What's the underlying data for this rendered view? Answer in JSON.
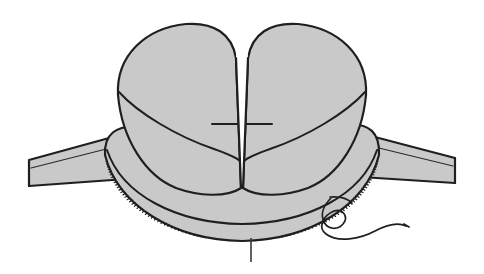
{
  "figure": {
    "title": "Surgical line illustration: split tubular tissue lobes within a serrated cuff",
    "caption": "",
    "background_color": "#ffffff",
    "style": "black-and-white halftone line drawing"
  },
  "palette": {
    "tissue_fill": "#c9c9c9",
    "band_fill": "#c9c9c9",
    "outline": "#1f1f1f",
    "inner_line": "#1f1f1f",
    "thin_line": "#2a2a2a",
    "suture_line": "#1f1f1f",
    "leader_line": "#3a3a3a",
    "paper": "#ffffff"
  },
  "canvas": {
    "width": 484,
    "height": 274
  },
  "parts": [
    {
      "id": "left-lobe",
      "label": "Left tissue lobe",
      "description": "Rounded cylindrical flap on the left of the central cleft, shaded gray with a curved sweep line across its face",
      "fill": "#c9c9c9"
    },
    {
      "id": "right-lobe",
      "label": "Right tissue lobe",
      "description": "Mirror-image rounded cylindrical flap on the right of the central cleft",
      "fill": "#c9c9c9"
    },
    {
      "id": "central-cleft",
      "label": "Central V-shaped cleft",
      "description": "White wedge separating the two lobes, converging to a point at the cuff rim",
      "fill": "#ffffff"
    },
    {
      "id": "cuff-apron",
      "label": "Curved cuff / apron",
      "description": "Broad crescent-shaped collar wrapping beneath both lobes",
      "fill": "#c9c9c9"
    },
    {
      "id": "serrated-edge",
      "label": "Serrated cut margin",
      "description": "Row of fine hatched teeth along the lower rim of the cuff"
    },
    {
      "id": "left-band",
      "label": "Left flat band",
      "description": "Flat strip running from the left edge of the frame to behind the cuff",
      "fill": "#c9c9c9"
    },
    {
      "id": "right-band",
      "label": "Right flat band",
      "description": "Flat strip running from behind the cuff out to the right edge of the frame",
      "fill": "#c9c9c9"
    },
    {
      "id": "suture-thread",
      "label": "Suture thread",
      "description": "Single looping thread emerging from the lower right edge of the cuff and trailing off to the right"
    },
    {
      "id": "leader-tick",
      "label": "Leader tick mark",
      "description": "Short vertical pointer line below the center of the serrated edge"
    }
  ],
  "annotations": {
    "labels": [],
    "numbers": []
  }
}
